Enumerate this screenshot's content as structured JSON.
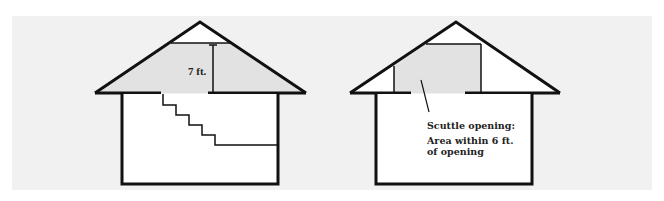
{
  "diagram": {
    "left_house": {
      "height_label": "7 ft.",
      "colors": {
        "shaded_area": "#e2e2e2",
        "outline": "#111111",
        "wall_fill": "#ffffff"
      }
    },
    "right_house": {
      "callout_title": "Scuttle opening:",
      "callout_line1": "Area within 6 ft.",
      "callout_line2": "of opening",
      "colors": {
        "shaded_area": "#e2e2e2",
        "outline": "#111111",
        "wall_fill": "#ffffff"
      }
    },
    "background_color": "#f1f1f1"
  }
}
